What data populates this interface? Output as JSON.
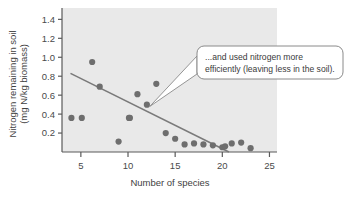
{
  "chart_data": {
    "type": "scatter",
    "title": "",
    "xlabel": "Number of species",
    "ylabel": "Nitrogen remaining in soil (mg N/kg biomass)",
    "ylabel_line1": "Nitrogen remaining in soil",
    "ylabel_line2": "(mg N/kg biomass)",
    "xlim": [
      3,
      25.8
    ],
    "ylim": [
      0,
      1.52
    ],
    "xticks": [
      5,
      10,
      15,
      20,
      25
    ],
    "xtick_labels": [
      "5",
      "10",
      "15",
      "20",
      "25"
    ],
    "yticks": [
      0.2,
      0.4,
      0.6,
      0.8,
      1.0,
      1.2,
      1.4
    ],
    "ytick_labels": [
      "0.2",
      "0.4",
      "0.6",
      "0.8",
      "1.0",
      "1.2",
      "1.4"
    ],
    "grid": false,
    "legend": "none",
    "x": [
      4.0,
      5.1,
      6.2,
      7.0,
      9.0,
      10.1,
      10.2,
      11.0,
      12.0,
      13.0,
      14.0,
      15.0,
      16.0,
      17.0,
      18.0,
      19.0,
      20.0,
      20.3,
      21.0,
      22.0,
      23.0
    ],
    "y": [
      0.36,
      0.36,
      0.95,
      0.69,
      0.11,
      0.36,
      0.36,
      0.61,
      0.5,
      0.72,
      0.2,
      0.14,
      0.08,
      0.09,
      0.08,
      0.07,
      0.05,
      0.06,
      0.09,
      0.1,
      0.04
    ],
    "point_color": "#6e6e6e",
    "point_radius": 3.1,
    "trendline": {
      "x": [
        3.9,
        20.7
      ],
      "y": [
        0.83,
        0.0
      ],
      "color": "#7a7a7a",
      "width": 1.6
    },
    "annotations": [
      {
        "name": "nitrogen-efficiency-callout",
        "line1": "...and used nitrogen more",
        "line2": "efficiently (leaving less in the soil).",
        "points_to_x": 12.3,
        "points_to_y": 0.48
      }
    ],
    "colors": {
      "plot_background": "#e9e9e9",
      "axis": "#5a5a5a",
      "callout_border": "#8a8a8a",
      "callout_fill": "#ffffff"
    }
  }
}
